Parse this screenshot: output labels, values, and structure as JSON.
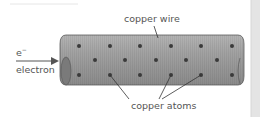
{
  "diagram": {
    "labels": {
      "wire": "copper wire",
      "electron_symbol": "e",
      "electron_charge": "−",
      "electron": "electron",
      "atoms": "copper atoms"
    },
    "colors": {
      "wire_fill": "#9a9a9a",
      "wire_dark": "#6e6e6e",
      "atom": "#3a3a3a",
      "text": "#555555",
      "arrow": "#555555"
    }
  }
}
